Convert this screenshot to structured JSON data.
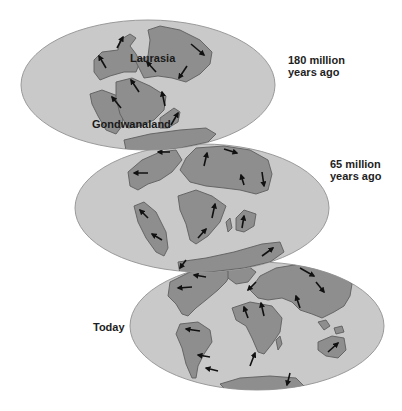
{
  "stages": [
    {
      "id": "180mya",
      "era_label_line1": "180 million",
      "era_label_line2": "years ago",
      "map_labels": [
        "Laurasia",
        "Gondwanaland"
      ]
    },
    {
      "id": "65mya",
      "era_label_line1": "65 million",
      "era_label_line2": "years ago",
      "map_labels": []
    },
    {
      "id": "today",
      "era_label_line1": "Today",
      "era_label_line2": "",
      "map_labels": []
    }
  ],
  "legend": {
    "arrow_meaning": "direction of plate movement"
  },
  "colors": {
    "ocean": "#c9c9c9",
    "land": "#8e8e8e",
    "outline": "#5e5e5e",
    "arrow": "#111111"
  }
}
